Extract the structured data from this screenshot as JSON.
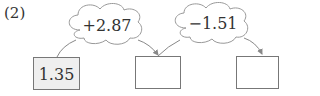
{
  "problem_label": "(2)",
  "start_value": "1.35",
  "operations": [
    {
      "label": "+2.87"
    },
    {
      "label": "−1.51"
    }
  ],
  "answer_boxes": [
    "",
    ""
  ],
  "colors": {
    "line": "#888888",
    "box_fill": "#efefef",
    "text": "#333333"
  }
}
